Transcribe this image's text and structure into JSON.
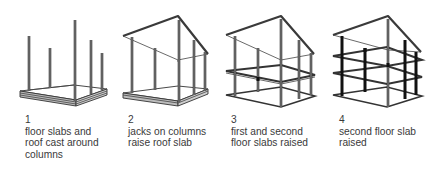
{
  "diagram": {
    "title": "",
    "colors": {
      "ink": "#333333",
      "background": "#ffffff",
      "caption": "#3a3a3a"
    },
    "panels": [
      {
        "number": "1",
        "caption_lines": [
          "floor slabs and",
          "roof cast around",
          "columns"
        ],
        "stage": "slabs cast at ground level"
      },
      {
        "number": "2",
        "caption_lines": [
          "jacks on columns",
          "raise roof slab"
        ],
        "stage": "roof slab raised"
      },
      {
        "number": "3",
        "caption_lines": [
          "first and second",
          "floor slabs raised"
        ],
        "stage": "first and second floor slabs raised"
      },
      {
        "number": "4",
        "caption_lines": [
          "second floor slab",
          "raised"
        ],
        "stage": "second floor slab raised"
      }
    ]
  }
}
